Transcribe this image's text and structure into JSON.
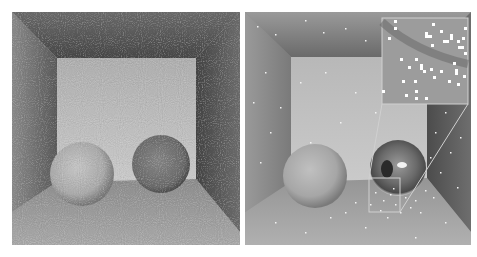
{
  "figure": {
    "panels": [
      {
        "id": "left",
        "description": "Noisy Cornell box render with two diffuse spheres",
        "rect": {
          "x": 12,
          "y": 12,
          "w": 228,
          "h": 233
        }
      },
      {
        "id": "right",
        "description": "Cornell box render with diffuse and mirror sphere, sparse firefly artifacts, zoomed inset",
        "rect": {
          "x": 245,
          "y": 12,
          "w": 226,
          "h": 233
        },
        "inset": {
          "box": {
            "x": 382,
            "y": 18,
            "w": 86,
            "h": 86
          },
          "source_box": {
            "x": 369,
            "y": 178,
            "w": 31,
            "h": 34
          },
          "outline_color": "#c8c8c8"
        }
      }
    ],
    "colors": {
      "background": "#ffffff",
      "ceiling": "#5e5e5e",
      "back_wall": "#bdbdbd",
      "side_wall_left": "#7c7c7c",
      "side_wall_right": "#5a5a5a",
      "floor": "#9a9a9a",
      "sphere_light": "#b8b8b8",
      "sphere_dark": "#6e6e6e",
      "firefly": "#ffffff"
    }
  }
}
